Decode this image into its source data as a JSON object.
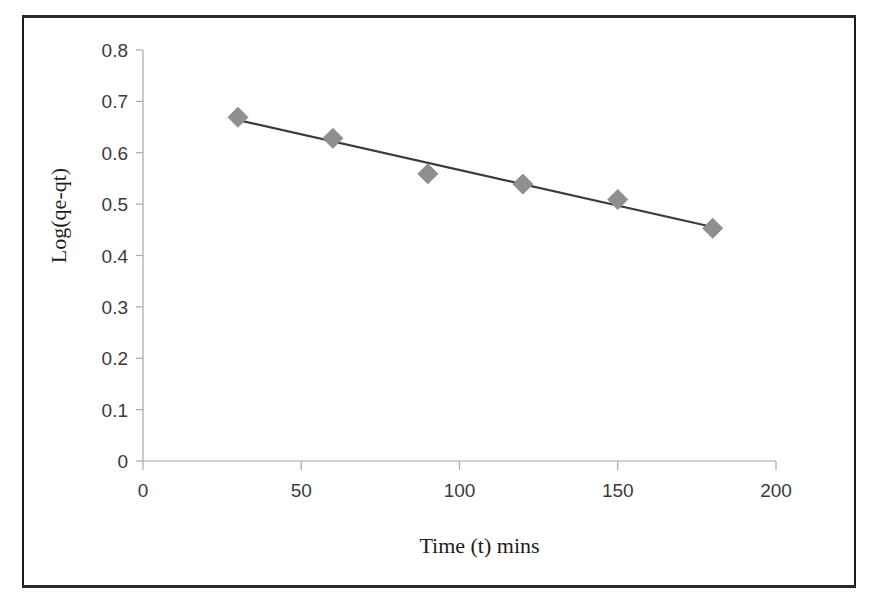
{
  "figure": {
    "frame_border_color": "#1a1a1a",
    "background_color": "#ffffff"
  },
  "chart_data": {
    "type": "scatter",
    "title": "",
    "subtitle": "",
    "xlabel": "Time (t) mins",
    "ylabel": "Log(qe-qt)",
    "xlim": [
      0,
      200
    ],
    "ylim": [
      0,
      0.8
    ],
    "xticks": [
      "0",
      "50",
      "100",
      "150",
      "200"
    ],
    "xtick_values": [
      0,
      50,
      100,
      150,
      200
    ],
    "yticks": [
      "0",
      "0.1",
      "0.2",
      "0.3",
      "0.4",
      "0.5",
      "0.6",
      "0.7",
      "0.8"
    ],
    "ytick_values": [
      0,
      0.1,
      0.2,
      0.3,
      0.4,
      0.5,
      0.6,
      0.7,
      0.8
    ],
    "grid": false,
    "legend": null,
    "legend_position": "none",
    "marker_shape": "diamond",
    "marker_color": "#8f8f8f",
    "line_color": "#3b3b3b",
    "trendline": true,
    "x": [
      30,
      60,
      90,
      120,
      150,
      180
    ],
    "y": [
      0.669,
      0.628,
      0.559,
      0.539,
      0.509,
      0.453
    ],
    "series": [
      {
        "name": "Log(qe-qt)",
        "x": [
          30,
          60,
          90,
          120,
          150,
          180
        ],
        "values": [
          0.669,
          0.628,
          0.559,
          0.539,
          0.509,
          0.453
        ]
      }
    ],
    "annotations": []
  }
}
